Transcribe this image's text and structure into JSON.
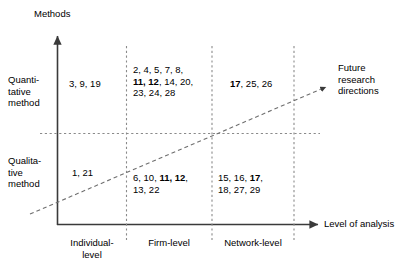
{
  "figure": {
    "y_axis_title": "Methods",
    "x_axis_title": "Level of analysis",
    "direction_arrow_label": "Future\nresearch\ndirections"
  },
  "row_labels": [
    {
      "id": "quantitative",
      "label": "Quanti-\ntative\nmethod"
    },
    {
      "id": "qualitative",
      "label": "Qualita-\ntive\nmethod"
    }
  ],
  "column_labels": [
    {
      "id": "individual-level",
      "label": "Individual-\nlevel"
    },
    {
      "id": "firm-level",
      "label": "Firm-level"
    },
    {
      "id": "network-level",
      "label": "Network-level"
    }
  ],
  "cells": [
    {
      "id": "quantitative-individual",
      "row": "Quantitative method",
      "column": "Individual-level",
      "text": "3, 9, 19",
      "segments": [
        {
          "t": "3, 9, 19",
          "bold": false
        }
      ]
    },
    {
      "id": "quantitative-firm",
      "row": "Quantitative method",
      "column": "Firm-level",
      "text": "2, 4, 5, 7, 8, 11, 12, 14, 20, 23, 24, 28",
      "segments": [
        {
          "t": "2, 4, 5, 7, 8,\n",
          "bold": false
        },
        {
          "t": "11, 12",
          "bold": true
        },
        {
          "t": ", 14, 20,\n23, 24, 28",
          "bold": false
        }
      ]
    },
    {
      "id": "quantitative-network",
      "row": "Quantitative method",
      "column": "Network-level",
      "text": "17, 25, 26",
      "segments": [
        {
          "t": "17",
          "bold": true
        },
        {
          "t": ", 25, 26",
          "bold": false
        }
      ]
    },
    {
      "id": "qualitative-individual",
      "row": "Qualitative method",
      "column": "Individual-level",
      "text": "1, 21",
      "segments": [
        {
          "t": "1, 21",
          "bold": false
        }
      ]
    },
    {
      "id": "qualitative-firm",
      "row": "Qualitative method",
      "column": "Firm-level",
      "text": "6, 10, 11, 12, 13, 22",
      "segments": [
        {
          "t": "6, 10, ",
          "bold": false
        },
        {
          "t": "11, 12",
          "bold": true
        },
        {
          "t": ",\n13, 22",
          "bold": false
        }
      ]
    },
    {
      "id": "qualitative-network",
      "row": "Qualitative method",
      "column": "Network-level",
      "text": "15, 16, 17, 18, 27, 29",
      "segments": [
        {
          "t": "15, 16, ",
          "bold": false
        },
        {
          "t": "17",
          "bold": true
        },
        {
          "t": ",\n18, 27, 29",
          "bold": false
        }
      ]
    }
  ],
  "chart_data": {
    "type": "table",
    "title": "",
    "xlabel": "Level of analysis",
    "ylabel": "Methods",
    "categories": [
      "Individual-level",
      "Firm-level",
      "Network-level"
    ],
    "rows": [
      "Quantitative method",
      "Qualitative method"
    ],
    "grid": true,
    "legend": "none",
    "annotations": [
      "Future research directions"
    ],
    "matrix": [
      [
        "3, 9, 19",
        "2, 4, 5, 7, 8, 11, 12, 14, 20, 23, 24, 28",
        "17, 25, 26"
      ],
      [
        "1, 21",
        "6, 10, 11, 12, 13, 22",
        "15, 16, 17, 18, 27, 29"
      ]
    ]
  },
  "colors": {
    "line": "#4d4d4d",
    "text": "#000000",
    "dashed": "#7a7a7a"
  }
}
